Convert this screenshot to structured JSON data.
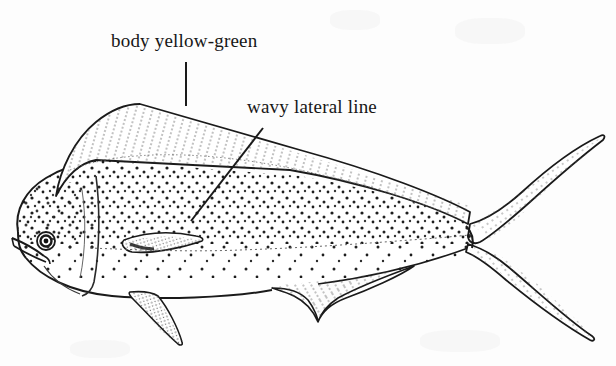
{
  "figure": {
    "kind": "line-drawing",
    "background_color": "#fdfdfd",
    "ink_color": "#1a1a1a",
    "width": 616,
    "height": 366
  },
  "labels": [
    {
      "id": "body-color",
      "text": "body yellow-green",
      "x": 111,
      "y": 30,
      "leader": {
        "type": "vertical",
        "x1": 186,
        "y1": 62,
        "x2": 186,
        "y2": 106
      }
    },
    {
      "id": "lateral-line",
      "text": "wavy lateral line",
      "x": 247,
      "y": 96,
      "leader": {
        "type": "diagonal",
        "x1": 263,
        "y1": 128,
        "x2": 191,
        "y2": 221
      }
    }
  ],
  "anatomy": {
    "head": "blunt-forehead",
    "eye": {
      "cx": 46,
      "cy": 241,
      "r": 6
    },
    "dorsal_fin": "long-hatched-crest",
    "pectoral_fin": "narrow-pointed-blade",
    "pelvic_fin": "long-tapering",
    "anal_fin": "hatched-lobe",
    "caudal_fin": "deeply-forked",
    "body_pattern": "stippled-spots",
    "lateral_line": "wavy-dotted"
  }
}
